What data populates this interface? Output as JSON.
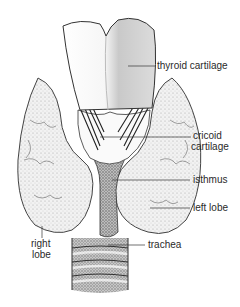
{
  "figure": {
    "labels": {
      "thyroid_cartilage": "thyroid cartilage",
      "cricoid_line1": "cricoid",
      "cricoid_line2": "cartilage",
      "isthmus": "isthmus",
      "left_lobe": "left lobe",
      "right_lobe_line1": "right",
      "right_lobe_line2": "lobe",
      "trachea": "trachea"
    },
    "colors": {
      "background": "#ffffff",
      "ink": "#2a2a2a",
      "stipple_dark": "#555555",
      "stipple_light": "#d8d8d8"
    }
  }
}
